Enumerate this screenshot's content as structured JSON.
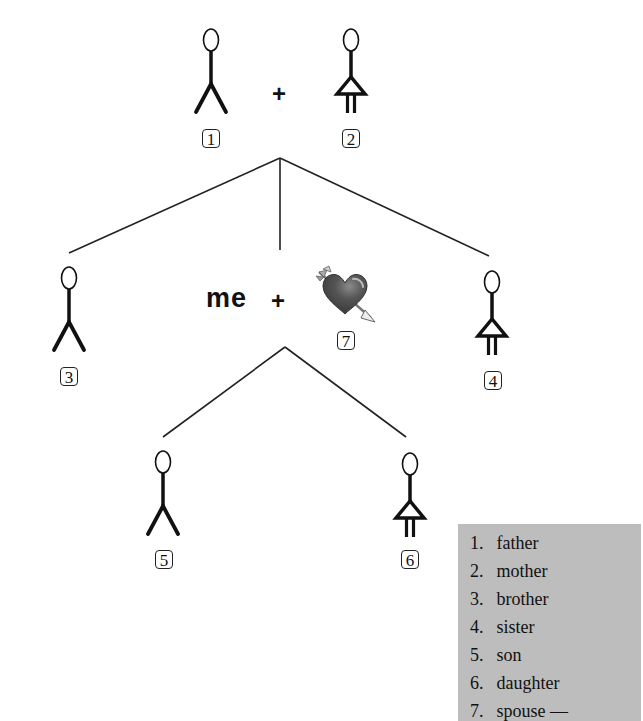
{
  "diagram": {
    "plus_sign": "+",
    "me_label": "me",
    "people": [
      {
        "id": "1",
        "role": "father",
        "icon": "male-stick-figure-icon"
      },
      {
        "id": "2",
        "role": "mother",
        "icon": "female-stick-figure-icon"
      },
      {
        "id": "3",
        "role": "brother",
        "icon": "male-stick-figure-icon"
      },
      {
        "id": "4",
        "role": "sister",
        "icon": "female-stick-figure-icon"
      },
      {
        "id": "5",
        "role": "son",
        "icon": "male-stick-figure-icon"
      },
      {
        "id": "6",
        "role": "daughter",
        "icon": "female-stick-figure-icon"
      },
      {
        "id": "7",
        "role": "spouse",
        "icon": "heart-with-arrow-icon"
      }
    ]
  },
  "legend": {
    "items": [
      {
        "num": "1.",
        "label": "father"
      },
      {
        "num": "2.",
        "label": "mother"
      },
      {
        "num": "3.",
        "label": "brother"
      },
      {
        "num": "4.",
        "label": "sister"
      },
      {
        "num": "5.",
        "label": "son"
      },
      {
        "num": "6.",
        "label": "daughter"
      },
      {
        "num": "7.",
        "label": "spouse —"
      }
    ],
    "background_color": "#bdbdbd"
  }
}
